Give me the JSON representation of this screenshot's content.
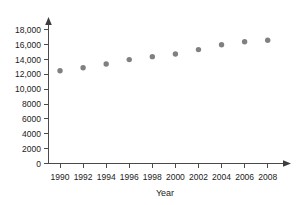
{
  "chart_data": {
    "type": "scatter",
    "title": "",
    "xlabel": "Year",
    "ylabel": "",
    "x": [
      1990,
      1992,
      1994,
      1996,
      1998,
      2000,
      2002,
      2004,
      2006,
      2008
    ],
    "values": [
      12500,
      12900,
      13400,
      14000,
      14400,
      14750,
      15350,
      16000,
      16400,
      16600
    ],
    "series": [
      {
        "name": "",
        "values": [
          12500,
          12900,
          13400,
          14000,
          14400,
          14750,
          15350,
          16000,
          16400,
          16600
        ]
      }
    ],
    "xlim": [
      1989,
      2009.5
    ],
    "ylim": [
      0,
      18800
    ],
    "x_tick_labels": [
      "1990",
      "1992",
      "1994",
      "1996",
      "1998",
      "2000",
      "2002",
      "2004",
      "2006",
      "2008"
    ],
    "x_tick_values": [
      1990,
      1992,
      1994,
      1996,
      1998,
      2000,
      2002,
      2004,
      2006,
      2008
    ],
    "y_tick_labels": [
      "0",
      "2000",
      "4000",
      "6000",
      "8000",
      "10,000",
      "12,000",
      "14,000",
      "16,000",
      "18,000"
    ],
    "y_tick_values": [
      0,
      2000,
      4000,
      6000,
      8000,
      10000,
      12000,
      14000,
      16000,
      18000
    ],
    "grid": false,
    "legend": false,
    "marker_color": "#808080",
    "axis_color": "#4a4a4a"
  }
}
